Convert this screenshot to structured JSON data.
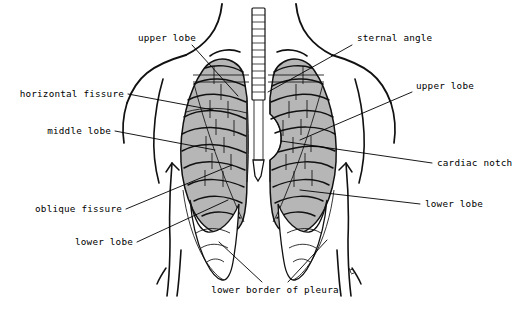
{
  "figure": {
    "background_color": "#ffffff",
    "ink_color": "#000000",
    "lung_fill_color": "#b6b6b6",
    "pleura_fill_color": "#ffffff",
    "width": 517,
    "height": 318
  },
  "labels": {
    "upper_lobe_left": "upper lobe",
    "sternal_angle": "sternal angle",
    "horizontal_fissure": "horizontal fissure",
    "upper_lobe_right": "upper lobe",
    "middle_lobe": "middle lobe",
    "cardiac_notch": "cardiac notch",
    "oblique_fissure": "oblique fissure",
    "lower_lobe_right": "lower lobe",
    "lower_lobe_left": "lower lobe",
    "lower_border_of_pleura": "lower border of pleura"
  },
  "structures": [
    {
      "name": "trachea",
      "description": "ladder-like midline airway above the lungs"
    },
    {
      "name": "right-lung",
      "description": "gray shaded lung on image left with horizontal and oblique fissures"
    },
    {
      "name": "left-lung",
      "description": "gray shaded lung on image right with cardiac notch"
    },
    {
      "name": "pleural-recess-right",
      "description": "white costodiaphragmatic recess below right lung"
    },
    {
      "name": "pleural-recess-left",
      "description": "white costodiaphragmatic recess below left lung"
    },
    {
      "name": "clavicle-right",
      "description": "horizontal bone lines across right lung apex"
    },
    {
      "name": "clavicle-left",
      "description": "horizontal bone lines across left lung apex"
    },
    {
      "name": "xiphoid-process",
      "description": "small midline white point below the sternum"
    },
    {
      "name": "torso-outline",
      "description": "neck, shoulders, arms and flanks silhouette"
    }
  ]
}
